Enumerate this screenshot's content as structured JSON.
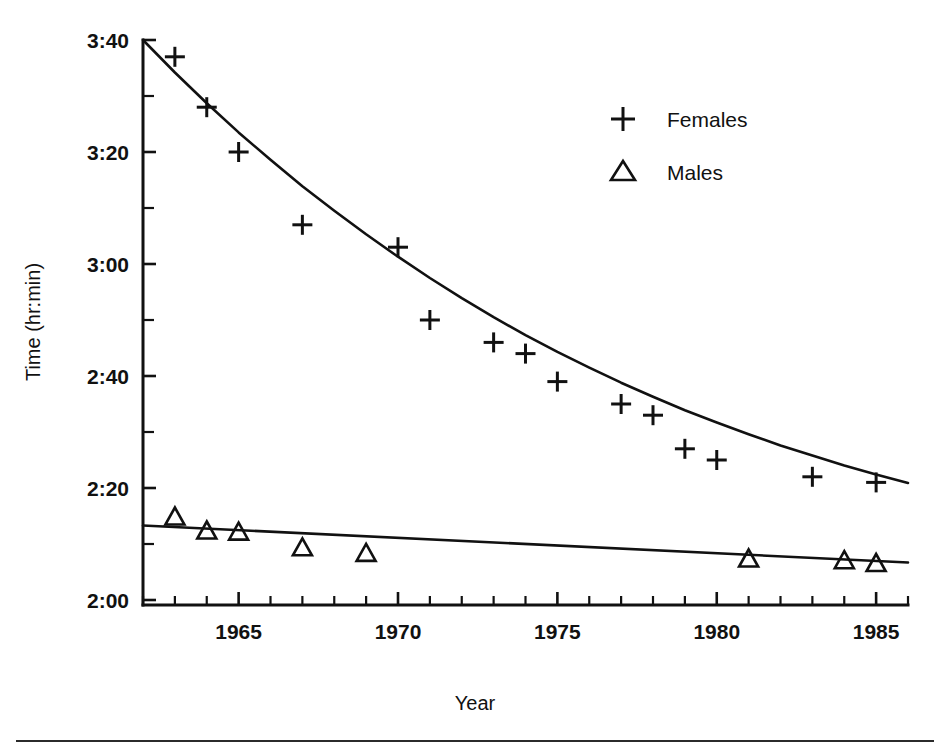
{
  "chart_data": {
    "type": "scatter",
    "title": "",
    "subtitle": "",
    "xlabel": "Year",
    "ylabel": "Time (hr:min)",
    "xlim": [
      1962,
      1986
    ],
    "ylim": [
      115,
      225
    ],
    "y_unit": "minutes",
    "y_display_format": "hr:min",
    "grid": false,
    "legend_position": "top-right",
    "x_ticks_major": [
      1965,
      1970,
      1975,
      1980,
      1985
    ],
    "x_tick_labels": [
      "1965",
      "1970",
      "1975",
      "1980",
      "1985"
    ],
    "x_ticks_minor_step": 1,
    "y_ticks_major_minutes": [
      220,
      200,
      180,
      160,
      140,
      120
    ],
    "y_tick_labels": [
      "3:40",
      "3:20",
      "3:00",
      "2:40",
      "2:20",
      "2:00"
    ],
    "y_ticks_minor_minutes": [
      210,
      190,
      170,
      150,
      130
    ],
    "series": [
      {
        "name": "Females",
        "marker": "plus",
        "fit": "curve",
        "x": [
          1963,
          1964,
          1965,
          1967,
          1970,
          1971,
          1973,
          1974,
          1975,
          1977,
          1978,
          1979,
          1980,
          1983,
          1985
        ],
        "y_minutes": [
          217,
          208,
          200,
          187,
          183,
          170,
          166,
          164,
          159,
          155,
          153,
          147,
          145,
          142,
          141
        ],
        "y_labels": [
          "3:37",
          "3:28",
          "3:20",
          "3:07",
          "3:03",
          "2:50",
          "2:46",
          "2:44",
          "2:39",
          "2:35",
          "2:33",
          "2:27",
          "2:25",
          "2:22",
          "2:21"
        ]
      },
      {
        "name": "Males",
        "marker": "triangle",
        "fit": "line",
        "x": [
          1963,
          1964,
          1965,
          1967,
          1969,
          1981,
          1984,
          1985
        ],
        "y_minutes": [
          135,
          132.5,
          132.3,
          129.5,
          128.5,
          127.5,
          127.2,
          126.7
        ],
        "y_labels": [
          "2:15",
          "2:12",
          "2:12",
          "2:09",
          "2:08",
          "2:07",
          "2:07",
          "2:06"
        ]
      }
    ],
    "fit_curves": {
      "females": [
        [
          1962.0,
          220.0
        ],
        [
          1963.0,
          214.2
        ],
        [
          1964.0,
          208.7
        ],
        [
          1965.0,
          203.5
        ],
        [
          1966.0,
          198.6
        ],
        [
          1967.0,
          193.9
        ],
        [
          1968.0,
          189.5
        ],
        [
          1969.0,
          185.3
        ],
        [
          1970.0,
          181.3
        ],
        [
          1971.0,
          177.5
        ],
        [
          1972.0,
          173.9
        ],
        [
          1973.0,
          170.5
        ],
        [
          1974.0,
          167.3
        ],
        [
          1975.0,
          164.3
        ],
        [
          1976.0,
          161.5
        ],
        [
          1977.0,
          158.8
        ],
        [
          1978.0,
          156.3
        ],
        [
          1979.0,
          153.9
        ],
        [
          1980.0,
          151.7
        ],
        [
          1981.0,
          149.6
        ],
        [
          1982.0,
          147.6
        ],
        [
          1983.0,
          145.8
        ],
        [
          1984.0,
          144.0
        ],
        [
          1985.0,
          142.4
        ],
        [
          1986.0,
          140.9
        ]
      ],
      "males": [
        [
          1962.0,
          133.3
        ],
        [
          1986.0,
          126.7
        ]
      ]
    }
  },
  "legend": {
    "items": [
      {
        "symbol": "+",
        "label": "Females"
      },
      {
        "symbol": "△",
        "label": "Males"
      }
    ]
  },
  "axes": {
    "x_title": "Year",
    "y_title": "Time (hr:min)"
  }
}
